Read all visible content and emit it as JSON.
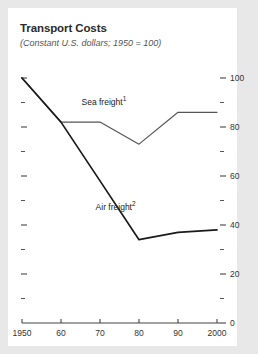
{
  "chart_data": {
    "type": "line",
    "title": "Transport Costs",
    "subtitle": "(Constant U.S. dollars; 1950 = 100)",
    "xlabel": "",
    "ylabel": "",
    "x": [
      1950,
      1960,
      1970,
      1980,
      1990,
      2000
    ],
    "xtick_labels": [
      "1950",
      "60",
      "70",
      "80",
      "90",
      "2000"
    ],
    "ylim": [
      0,
      100
    ],
    "xlim": [
      1950,
      2000
    ],
    "ytick_labels": [
      "0",
      "20",
      "40",
      "60",
      "80",
      "100"
    ],
    "ytick_values": [
      0,
      20,
      40,
      60,
      80,
      100
    ],
    "yminor_values": [
      10,
      30,
      50,
      70,
      90
    ],
    "grid": false,
    "legend_position": "inline-annotation",
    "series": [
      {
        "name": "Sea freight",
        "footnote": "1",
        "values": [
          100,
          82,
          82,
          73,
          86,
          86
        ],
        "color": "#555555"
      },
      {
        "name": "Air freight",
        "footnote": "2",
        "values": [
          100,
          82,
          58,
          34,
          37,
          38
        ],
        "color": "#1a1a1a"
      }
    ],
    "annotations": [
      {
        "text": "Sea freight",
        "footnote": "1",
        "x": 1971,
        "y": 90
      },
      {
        "text": "Air freight",
        "footnote": "2",
        "x": 1974,
        "y": 47
      }
    ]
  }
}
